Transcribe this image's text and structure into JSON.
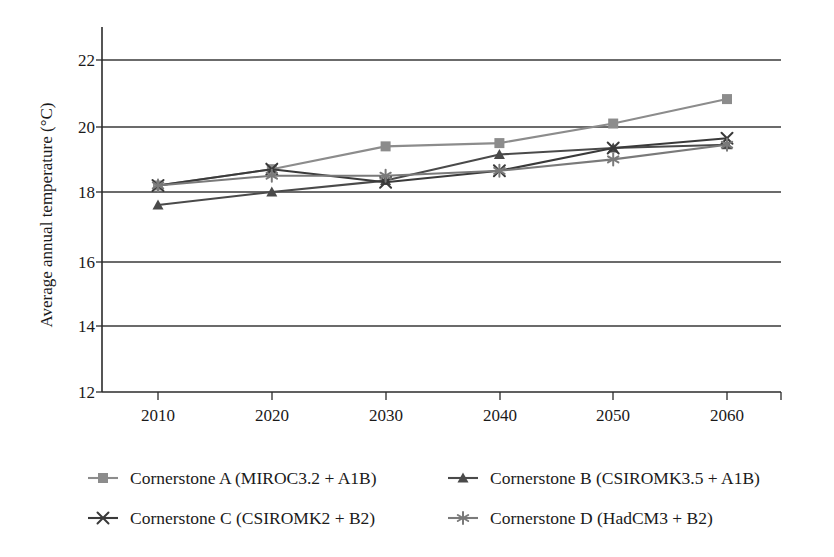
{
  "chart_data": {
    "type": "line",
    "title": "",
    "xlabel": "",
    "ylabel": "Average annual temperature (°C)",
    "categories": [
      "2010",
      "2020",
      "2030",
      "2040",
      "2050",
      "2060"
    ],
    "x": [
      2010,
      2020,
      2030,
      2040,
      2050,
      2060
    ],
    "xlim": [
      2005,
      2065
    ],
    "ylim": [
      12,
      22.8
    ],
    "yticks": [
      12,
      14,
      16,
      18,
      20,
      22
    ],
    "ytick_labels": [
      "12",
      "14",
      "16",
      "18",
      "20",
      "22"
    ],
    "grid": "horizontal",
    "legend_position": "bottom",
    "series": [
      {
        "name": "Cornerstone A (MIROC3.2 + A1B)",
        "marker": "square",
        "color": "#8c8c8c",
        "values": [
          18.2,
          18.7,
          19.4,
          19.5,
          20.1,
          20.85
        ]
      },
      {
        "name": "Cornerstone B (CSIROMK3.5 + A1B)",
        "marker": "triangle",
        "color": "#4a4a4a",
        "values": [
          17.6,
          18.0,
          18.35,
          19.15,
          19.35,
          19.45
        ]
      },
      {
        "name": "Cornerstone C (CSIROMK2 + B2)",
        "marker": "x",
        "color": "#3a3a3a",
        "values": [
          18.2,
          18.7,
          18.3,
          18.65,
          19.35,
          19.65
        ]
      },
      {
        "name": "Cornerstone D (HadCM3 + B2)",
        "marker": "star",
        "color": "#7a7a7a",
        "values": [
          18.2,
          18.5,
          18.5,
          18.65,
          19.0,
          19.45
        ]
      }
    ]
  },
  "axis": {
    "ylabel": "Average annual temperature (°C)",
    "ytick_labels": [
      "22",
      "20",
      "18",
      "16",
      "14",
      "12"
    ],
    "xtick_labels": [
      "2010",
      "2020",
      "2030",
      "2040",
      "2050",
      "2060"
    ]
  },
  "legend": {
    "entries": [
      {
        "label": "Cornerstone A (MIROC3.2 + A1B)",
        "marker": "square",
        "color": "#8c8c8c"
      },
      {
        "label": "Cornerstone B (CSIROMK3.5 + A1B)",
        "marker": "triangle",
        "color": "#4a4a4a"
      },
      {
        "label": "Cornerstone C (CSIROMK2 + B2)",
        "marker": "x",
        "color": "#3a3a3a"
      },
      {
        "label": "Cornerstone D (HadCM3 + B2)",
        "marker": "star",
        "color": "#7a7a7a"
      }
    ]
  }
}
